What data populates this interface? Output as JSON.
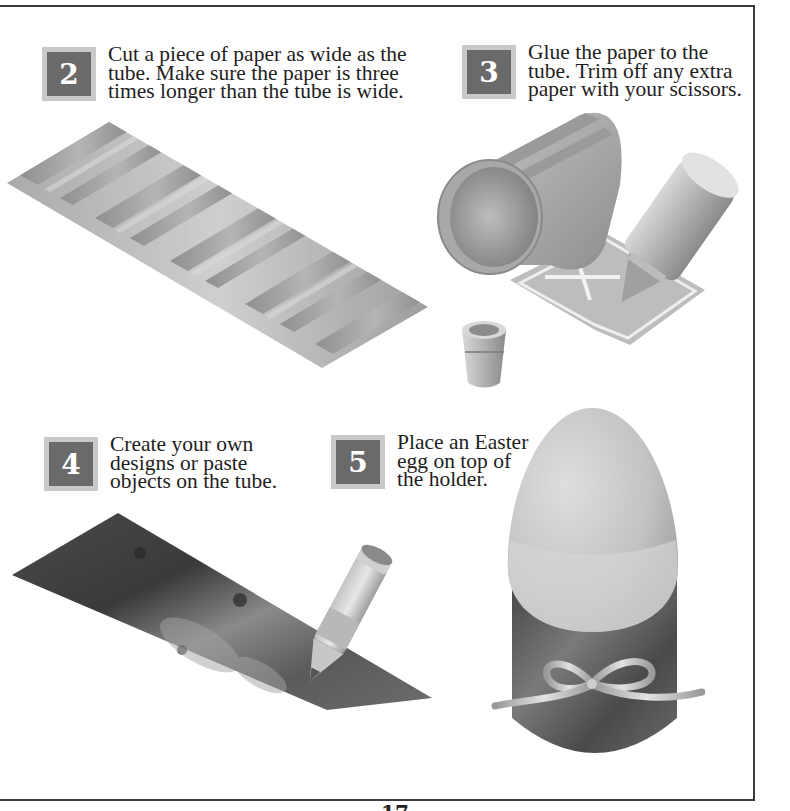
{
  "page": {
    "page_number": "17",
    "frame_color": "#3a3a3a",
    "badge_outer_color": "#c9c9c9",
    "badge_inner_color": "#6a6a6a"
  },
  "steps": [
    {
      "number": "2",
      "lines": [
        "Cut a piece of paper as wide as the",
        "tube. Make sure the paper is three",
        "times longer than the tube is wide."
      ],
      "illustration": "striped-paper-strip"
    },
    {
      "number": "3",
      "lines": [
        "Glue the paper to the",
        "tube. Trim off any extra",
        "paper with your scissors."
      ],
      "illustration": "tube-with-glue"
    },
    {
      "number": "4",
      "lines": [
        "Create your own",
        "designs or paste",
        "objects on the tube."
      ],
      "illustration": "decorated-paper-with-pencil"
    },
    {
      "number": "5",
      "lines": [
        "Place an Easter",
        "egg on top of",
        "the holder."
      ],
      "illustration": "egg-on-holder"
    }
  ]
}
